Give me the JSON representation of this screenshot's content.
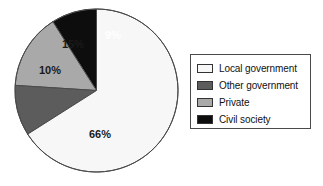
{
  "chart_data": {
    "type": "pie",
    "title": "",
    "subtitle": "",
    "xlabel": "",
    "ylabel": "",
    "unit": "%",
    "grid": false,
    "legend_position": "right",
    "start_angle_deg": 90,
    "direction": "counterclockwise",
    "categories": [
      "Local government",
      "Other government",
      "Private",
      "Civil society"
    ],
    "values": [
      66,
      10,
      15,
      9
    ],
    "labels": [
      "66%",
      "10%",
      "15%",
      "9%"
    ],
    "colors": [
      "#f7f7f7",
      "#5c5c5c",
      "#a9a9a9",
      "#0d0d0d"
    ],
    "slices": [
      {
        "name": "Civil society",
        "value": 9,
        "label": "9%",
        "color": "#0d0d0d",
        "label_color": "#ffffff",
        "label_x": 103,
        "label_y": 33
      },
      {
        "name": "Private",
        "value": 15,
        "label": "15%",
        "color": "#a9a9a9",
        "label_color": "#1a1a1a",
        "label_x": 63,
        "label_y": 42
      },
      {
        "name": "Other government",
        "value": 10,
        "label": "10%",
        "color": "#5c5c5c",
        "label_color": "#1a1a1a",
        "label_x": 40,
        "label_y": 68
      },
      {
        "name": "Local government",
        "value": 66,
        "label": "66%",
        "color": "#f7f7f7",
        "label_color": "#1a1a1a",
        "label_x": 90,
        "label_y": 132
      }
    ],
    "outline_color": "#4a4a4a"
  },
  "legend": {
    "border_color": "#4a4a4a",
    "items": [
      {
        "label": "Local government",
        "color": "#f7f7f7"
      },
      {
        "label": "Other government",
        "color": "#5c5c5c"
      },
      {
        "label": "Private",
        "color": "#a9a9a9"
      },
      {
        "label": "Civil society",
        "color": "#0d0d0d"
      }
    ]
  }
}
